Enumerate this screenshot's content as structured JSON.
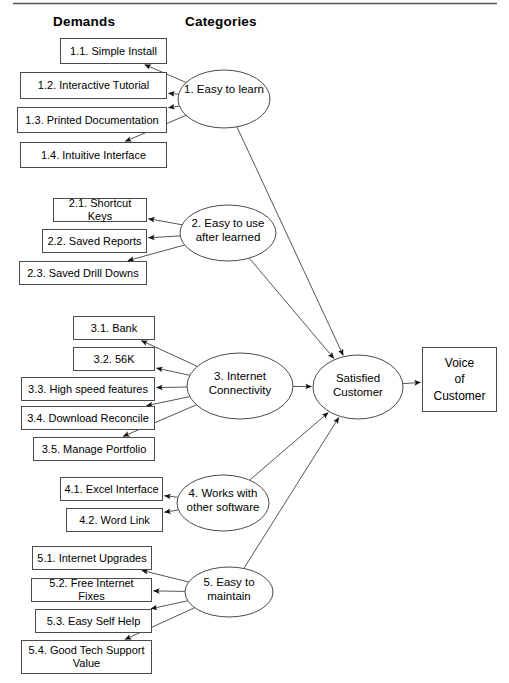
{
  "diagram": {
    "headers": {
      "demands": "Demands",
      "categories": "Categories"
    },
    "colors": {
      "stroke": "#4a4a4a",
      "line": "#555555",
      "text": "#000000",
      "background": "#ffffff"
    },
    "demands": [
      {
        "id": "1.1",
        "label": "1.1. Simple Install",
        "x": 60,
        "y": 38,
        "w": 107,
        "h": 26
      },
      {
        "id": "1.2",
        "label": "1.2. Interactive Tutorial",
        "x": 20,
        "y": 72,
        "w": 147,
        "h": 27
      },
      {
        "id": "1.3",
        "label": "1.3. Printed Documentation",
        "x": 17,
        "y": 107,
        "w": 150,
        "h": 26
      },
      {
        "id": "1.4",
        "label": "1.4. Intuitive Interface",
        "x": 20,
        "y": 142,
        "w": 147,
        "h": 26
      },
      {
        "id": "2.1",
        "label": "2.1. Shortcut Keys",
        "x": 53,
        "y": 198,
        "w": 94,
        "h": 24
      },
      {
        "id": "2.2",
        "label": "2.2. Saved Reports",
        "x": 42,
        "y": 229,
        "w": 105,
        "h": 24
      },
      {
        "id": "2.3",
        "label": "2.3. Saved Drill Downs",
        "x": 19,
        "y": 261,
        "w": 128,
        "h": 24
      },
      {
        "id": "3.1",
        "label": "3.1. Bank",
        "x": 73,
        "y": 316,
        "w": 82,
        "h": 24
      },
      {
        "id": "3.2",
        "label": "3.2. 56K",
        "x": 73,
        "y": 347,
        "w": 82,
        "h": 24
      },
      {
        "id": "3.3",
        "label": "3.3. High speed features",
        "x": 21,
        "y": 377,
        "w": 134,
        "h": 24
      },
      {
        "id": "3.4",
        "label": "3.4. Download Reconcile",
        "x": 21,
        "y": 406,
        "w": 134,
        "h": 24
      },
      {
        "id": "3.5",
        "label": "3.5. Manage Portfolio",
        "x": 33,
        "y": 437,
        "w": 122,
        "h": 24
      },
      {
        "id": "4.1",
        "label": "4.1. Excel Interface",
        "x": 60,
        "y": 477,
        "w": 103,
        "h": 24
      },
      {
        "id": "4.2",
        "label": "4.2. Word Link",
        "x": 66,
        "y": 508,
        "w": 97,
        "h": 24
      },
      {
        "id": "5.1",
        "label": "5.1. Internet Upgrades",
        "x": 32,
        "y": 546,
        "w": 120,
        "h": 24
      },
      {
        "id": "5.2",
        "label": "5.2. Free Internet Fixes",
        "x": 31,
        "y": 578,
        "w": 121,
        "h": 24
      },
      {
        "id": "5.3",
        "label": "5.3. Easy Self Help",
        "x": 35,
        "y": 609,
        "w": 117,
        "h": 24
      },
      {
        "id": "5.4",
        "label": "5.4. Good Tech Support\nValue",
        "x": 21,
        "y": 640,
        "w": 131,
        "h": 34
      }
    ],
    "categories": [
      {
        "id": "cat1",
        "label": "1. Easy to learn",
        "cx": 224,
        "cy": 99,
        "rx": 46,
        "ry": 29
      },
      {
        "id": "cat2",
        "label": "2. Easy to use\nafter learned",
        "cx": 228,
        "cy": 233,
        "rx": 48,
        "ry": 28
      },
      {
        "id": "cat3",
        "label": "3. Internet\nConnectivity",
        "cx": 240,
        "cy": 386,
        "rx": 53,
        "ry": 33
      },
      {
        "id": "cat4",
        "label": "4. Works with\nother software",
        "cx": 223,
        "cy": 503,
        "rx": 46,
        "ry": 28
      },
      {
        "id": "cat5",
        "label": "5. Easy to\nmaintain",
        "cx": 229,
        "cy": 592,
        "rx": 44,
        "ry": 25
      }
    ],
    "outcome": {
      "id": "satisfied-customer",
      "label": "Satisfied\nCustomer",
      "cx": 358,
      "cy": 387,
      "rx": 45,
      "ry": 32
    },
    "result": {
      "id": "voice-of-customer",
      "label": "Voice\nof\nCustomer",
      "x": 422,
      "y": 347,
      "w": 75,
      "h": 65
    },
    "edges": [
      {
        "from": "cat1",
        "to": "1.1"
      },
      {
        "from": "cat1",
        "to": "1.2"
      },
      {
        "from": "cat1",
        "to": "1.3"
      },
      {
        "from": "cat1",
        "to": "1.4"
      },
      {
        "from": "cat2",
        "to": "2.1"
      },
      {
        "from": "cat2",
        "to": "2.2"
      },
      {
        "from": "cat2",
        "to": "2.3"
      },
      {
        "from": "cat3",
        "to": "3.1"
      },
      {
        "from": "cat3",
        "to": "3.2"
      },
      {
        "from": "cat3",
        "to": "3.3"
      },
      {
        "from": "cat3",
        "to": "3.4"
      },
      {
        "from": "cat3",
        "to": "3.5"
      },
      {
        "from": "cat4",
        "to": "4.1"
      },
      {
        "from": "cat4",
        "to": "4.2"
      },
      {
        "from": "cat5",
        "to": "5.1"
      },
      {
        "from": "cat5",
        "to": "5.2"
      },
      {
        "from": "cat5",
        "to": "5.3"
      },
      {
        "from": "cat5",
        "to": "5.4"
      },
      {
        "from": "cat1",
        "to": "satisfied-customer"
      },
      {
        "from": "cat2",
        "to": "satisfied-customer"
      },
      {
        "from": "cat3",
        "to": "satisfied-customer"
      },
      {
        "from": "cat4",
        "to": "satisfied-customer"
      },
      {
        "from": "cat5",
        "to": "satisfied-customer"
      },
      {
        "from": "satisfied-customer",
        "to": "voice-of-customer"
      }
    ]
  }
}
